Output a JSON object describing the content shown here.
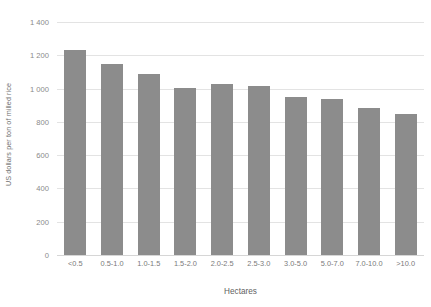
{
  "chart_data": {
    "type": "bar",
    "title": "",
    "xlabel": "Hectares",
    "ylabel": "US dollars per ton of milled rice",
    "categories": [
      "<0.5",
      "0.5-1.0",
      "1.0-1.5",
      "1.5-2.0",
      "2.0-2.5",
      "2.5-3.0",
      "3.0-5.0",
      "5.0-7.0",
      "7.0-10.0",
      ">10.0"
    ],
    "values": [
      1230,
      1150,
      1090,
      1005,
      1030,
      1015,
      950,
      935,
      885,
      850
    ],
    "ylim": [
      0,
      1400
    ],
    "yticks": [
      0,
      200,
      400,
      600,
      800,
      1000,
      1200,
      1400
    ],
    "ytick_labels": [
      "0",
      "200",
      "400",
      "600",
      "800",
      "1 000",
      "1 200",
      "1 400"
    ],
    "grid": true,
    "legend": false,
    "bar_color": "#8c8c8c",
    "gridline_color": "#e3e3e3",
    "background_color": "#ffffff"
  }
}
